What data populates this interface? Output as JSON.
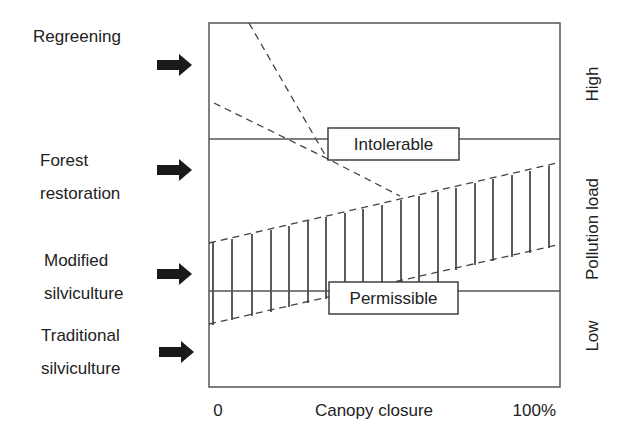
{
  "figure": {
    "left_labels": [
      {
        "id": "regreening",
        "lines": [
          "Regreening"
        ]
      },
      {
        "id": "forest-restoration",
        "lines": [
          "Forest",
          "restoration"
        ]
      },
      {
        "id": "modified-silviculture",
        "lines": [
          "Modified",
          "silviculture"
        ]
      },
      {
        "id": "traditional-silviculture",
        "lines": [
          "Traditional",
          "silviculture"
        ]
      }
    ],
    "thresholds": {
      "intolerable": "Intolerable",
      "permissible": "Permissible"
    },
    "x_axis": {
      "label": "Canopy closure",
      "min_label": "0",
      "max_label": "100%"
    },
    "y_axis": {
      "label": "Pollution load",
      "high_label": "High",
      "low_label": "Low"
    },
    "colors": {
      "line": "#555555",
      "arrow": "#1a1a1a",
      "text": "#222222"
    }
  }
}
